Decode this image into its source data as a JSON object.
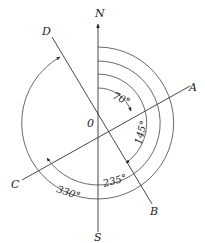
{
  "diagram": {
    "type": "bearing-diagram",
    "origin_label": "0",
    "compass": {
      "north": "N",
      "south": "S"
    },
    "directions": [
      {
        "label": "A",
        "bearing": "70°"
      },
      {
        "label": "B",
        "bearing": "145°"
      },
      {
        "label": "C",
        "bearing": "235°"
      },
      {
        "label": "D",
        "bearing": "330°"
      }
    ],
    "angle_labels": [
      "70°",
      "145°",
      "235°",
      "330°"
    ],
    "colors": {
      "line": "#333333",
      "text": "#222222",
      "background": "#ffffff"
    }
  }
}
